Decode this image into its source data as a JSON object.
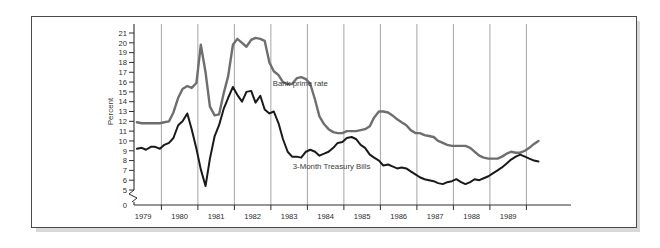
{
  "figure": {
    "background_color": "#ffffff",
    "frame_color": "#4a4a4a",
    "shadow_color": "#d9d9d9"
  },
  "chart_data": {
    "type": "line",
    "title": "",
    "xlabel": "Year",
    "ylabel": "Percent",
    "xlim": [
      1978.75,
      1989.9
    ],
    "ylim": [
      5,
      21
    ],
    "axis_break": "y-axis broken between 0 and 5",
    "y_zero_label": "0",
    "grid": "vertical gridlines at each year boundary",
    "legend_position": "inline annotations on plot",
    "ytick_labels": [
      "5",
      "6",
      "7",
      "8",
      "9",
      "10",
      "11",
      "12",
      "13",
      "14",
      "15",
      "16",
      "17",
      "18",
      "19",
      "20",
      "21"
    ],
    "ytick_values": [
      5,
      6,
      7,
      8,
      9,
      10,
      11,
      12,
      13,
      14,
      15,
      16,
      17,
      18,
      19,
      20,
      21
    ],
    "xtick_labels": [
      "1979",
      "1980",
      "1981",
      "1982",
      "1983",
      "1984",
      "1985",
      "1986",
      "1987",
      "1988",
      "1989"
    ],
    "xtick_values": [
      1979,
      1980,
      1981,
      1982,
      1983,
      1984,
      1985,
      1986,
      1987,
      1988,
      1989
    ],
    "gridline_values": [
      1979.5,
      1980.5,
      1981.5,
      1982.5,
      1983.5,
      1984.5,
      1985.5,
      1986.5,
      1987.5,
      1988.5,
      1989.5
    ],
    "series": [
      {
        "name": "Bank prime rate",
        "color": "#6e6e6e",
        "width": 2.4,
        "label_x": 1982.55,
        "label_y": 15.6,
        "x": [
          1978.83,
          1978.96,
          1979.08,
          1979.21,
          1979.33,
          1979.46,
          1979.58,
          1979.71,
          1979.83,
          1979.96,
          1980.08,
          1980.21,
          1980.33,
          1980.46,
          1980.58,
          1980.71,
          1980.83,
          1980.96,
          1981.08,
          1981.21,
          1981.33,
          1981.46,
          1981.58,
          1981.71,
          1981.83,
          1981.96,
          1982.08,
          1982.21,
          1982.33,
          1982.46,
          1982.58,
          1982.71,
          1982.83,
          1982.96,
          1983.08,
          1983.21,
          1983.33,
          1983.46,
          1983.58,
          1983.71,
          1983.83,
          1983.96,
          1984.08,
          1984.21,
          1984.33,
          1984.46,
          1984.58,
          1984.71,
          1984.83,
          1984.96,
          1985.08,
          1985.21,
          1985.33,
          1985.46,
          1985.58,
          1985.71,
          1985.83,
          1985.96,
          1986.08,
          1986.21,
          1986.33,
          1986.46,
          1986.58,
          1986.71,
          1986.83,
          1986.96,
          1987.08,
          1987.21,
          1987.33,
          1987.46,
          1987.58,
          1987.71,
          1987.83,
          1987.96,
          1988.08,
          1988.21,
          1988.33,
          1988.46,
          1988.58,
          1988.71,
          1988.83,
          1988.96,
          1989.08,
          1989.21,
          1989.33,
          1989.46,
          1989.58,
          1989.71,
          1989.83
        ],
        "values": [
          11.9,
          11.8,
          11.8,
          11.8,
          11.8,
          11.8,
          11.9,
          12.0,
          12.9,
          14.4,
          15.3,
          15.6,
          15.4,
          15.9,
          19.8,
          17.0,
          13.5,
          12.6,
          12.7,
          14.9,
          16.6,
          19.8,
          20.4,
          20.0,
          19.6,
          20.3,
          20.5,
          20.4,
          20.2,
          18.0,
          17.1,
          16.7,
          16.0,
          15.8,
          15.8,
          16.4,
          16.5,
          16.3,
          15.8,
          14.2,
          12.5,
          11.7,
          11.2,
          10.9,
          10.8,
          10.8,
          11.0,
          11.0,
          11.0,
          11.1,
          11.2,
          11.5,
          12.4,
          13.0,
          13.0,
          12.9,
          12.6,
          12.2,
          11.9,
          11.6,
          11.1,
          10.8,
          10.8,
          10.6,
          10.5,
          10.4,
          10.0,
          9.8,
          9.6,
          9.5,
          9.5,
          9.5,
          9.5,
          9.3,
          8.9,
          8.5,
          8.3,
          8.2,
          8.2,
          8.2,
          8.4,
          8.7,
          8.9,
          8.8,
          8.8,
          9.0,
          9.3,
          9.7,
          10.0
        ]
      },
      {
        "name": "3-Month Treasury Bills",
        "color": "#1a1a1a",
        "width": 2.0,
        "label_x": 1983.1,
        "label_y": 7.15,
        "x": [
          1978.83,
          1978.96,
          1979.08,
          1979.21,
          1979.33,
          1979.46,
          1979.58,
          1979.71,
          1979.83,
          1979.96,
          1980.08,
          1980.21,
          1980.33,
          1980.46,
          1980.58,
          1980.71,
          1980.83,
          1980.96,
          1981.08,
          1981.21,
          1981.33,
          1981.46,
          1981.58,
          1981.71,
          1981.83,
          1981.96,
          1982.08,
          1982.21,
          1982.33,
          1982.46,
          1982.58,
          1982.71,
          1982.83,
          1982.96,
          1983.08,
          1983.21,
          1983.33,
          1983.46,
          1983.58,
          1983.71,
          1983.83,
          1983.96,
          1984.08,
          1984.21,
          1984.33,
          1984.46,
          1984.58,
          1984.71,
          1984.83,
          1984.96,
          1985.08,
          1985.21,
          1985.33,
          1985.46,
          1985.58,
          1985.71,
          1985.83,
          1985.96,
          1986.08,
          1986.21,
          1986.33,
          1986.46,
          1986.58,
          1986.71,
          1986.83,
          1986.96,
          1987.08,
          1987.21,
          1987.33,
          1987.46,
          1987.58,
          1987.71,
          1987.83,
          1987.96,
          1988.08,
          1988.21,
          1988.33,
          1988.46,
          1988.58,
          1988.71,
          1988.83,
          1988.96,
          1989.08,
          1989.21,
          1989.33,
          1989.46,
          1989.58,
          1989.71,
          1989.83
        ],
        "values": [
          9.2,
          9.3,
          9.1,
          9.4,
          9.4,
          9.2,
          9.6,
          9.8,
          10.3,
          11.6,
          12.0,
          12.8,
          11.2,
          9.2,
          7.1,
          5.4,
          8.2,
          10.5,
          11.6,
          13.3,
          14.4,
          15.5,
          14.7,
          14.0,
          15.0,
          15.1,
          13.9,
          14.6,
          13.2,
          12.8,
          13.0,
          11.8,
          10.2,
          8.9,
          8.4,
          8.4,
          8.3,
          8.9,
          9.1,
          8.9,
          8.5,
          8.7,
          8.9,
          9.3,
          9.8,
          9.9,
          10.3,
          10.4,
          10.2,
          9.6,
          9.3,
          8.6,
          8.3,
          8.0,
          7.5,
          7.6,
          7.4,
          7.2,
          7.3,
          7.2,
          6.9,
          6.6,
          6.3,
          6.1,
          6.0,
          5.9,
          5.7,
          5.6,
          5.8,
          5.9,
          6.1,
          5.8,
          5.6,
          5.8,
          6.1,
          6.0,
          6.2,
          6.4,
          6.7,
          7.0,
          7.3,
          7.7,
          8.1,
          8.4,
          8.6,
          8.4,
          8.2,
          8.0,
          7.9
        ]
      }
    ]
  }
}
